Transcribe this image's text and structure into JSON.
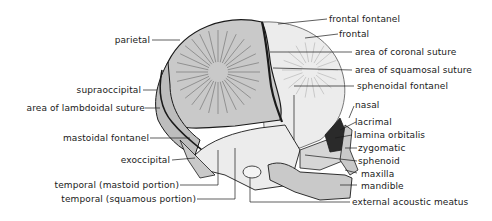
{
  "diagram": {
    "colors": {
      "parietal_fill": "#c9c9c9",
      "frontal_fill": "#ececec",
      "bone_outline": "#1a1a1a",
      "leader_line": "#1a1a1a",
      "background": "#ffffff"
    },
    "labels_left": [
      {
        "id": "parietal",
        "text": "parietal"
      },
      {
        "id": "supraoccipital",
        "text": "supraoccipital"
      },
      {
        "id": "lambdoidal",
        "text": "area of lambdoidal suture"
      },
      {
        "id": "mastoidal-fontanel",
        "text": "mastoidal fontanel"
      },
      {
        "id": "exoccipital",
        "text": "exoccipital"
      },
      {
        "id": "temporal-mastoid",
        "text": "temporal (mastoid portion)"
      },
      {
        "id": "temporal-squamous",
        "text": "temporal (squamous portion)"
      }
    ],
    "labels_right": [
      {
        "id": "frontal-fontanel",
        "text": "frontal fontanel"
      },
      {
        "id": "frontal",
        "text": "frontal"
      },
      {
        "id": "coronal",
        "text": "area of coronal suture"
      },
      {
        "id": "squamosal",
        "text": "area of squamosal suture"
      },
      {
        "id": "sphenoidal-fontanel",
        "text": "sphenoidal fontanel"
      },
      {
        "id": "nasal",
        "text": "nasal"
      },
      {
        "id": "lacrimal",
        "text": "lacrimal"
      },
      {
        "id": "lamina-orbitalis",
        "text": "lamina orbitalis"
      },
      {
        "id": "zygomatic",
        "text": "zygomatic"
      },
      {
        "id": "sphenoid",
        "text": "sphenoid"
      },
      {
        "id": "maxilla",
        "text": "maxilla"
      },
      {
        "id": "mandible",
        "text": "mandible"
      },
      {
        "id": "external-acoustic-meatus",
        "text": "external acoustic meatus"
      }
    ]
  }
}
